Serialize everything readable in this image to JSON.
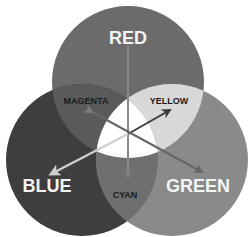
{
  "diagram": {
    "primaries": [
      {
        "label": "RED",
        "color": "#6b6b6b"
      },
      {
        "label": "BLUE",
        "color": "#3e3e3e"
      },
      {
        "label": "GREEN",
        "color": "#8a8a8a"
      }
    ],
    "secondaries": [
      {
        "label": "MAGENTA",
        "color": "#5a5a5a"
      },
      {
        "label": "YELLOW",
        "color": "#d8d8d8"
      },
      {
        "label": "CYAN",
        "color": "#6f6f6f"
      }
    ],
    "center": {
      "label": "",
      "color": "#ffffff"
    },
    "colors": {
      "background": "#ffffff",
      "primary_text": "#f4f4f4",
      "secondary_text": "#1a1a1a",
      "arrow_vertical": "#8a8a8a",
      "arrow_yellow": "#3a3a3a",
      "arrow_blue": "#cfcfcf",
      "arrow_green": "#666666"
    }
  }
}
